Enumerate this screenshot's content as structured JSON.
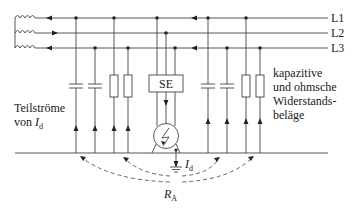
{
  "diagram": {
    "phases": [
      "L1",
      "L2",
      "L3"
    ],
    "phase_y": [
      18,
      33,
      48
    ],
    "ground_y": 153,
    "source_box_label": "SE",
    "labels": {
      "left_line1": "Teilströme",
      "left_line2_prefix": "von ",
      "left_line2_var": "I",
      "left_line2_sub": "d",
      "right_line1": "kapazitive",
      "right_line2": "und ohmsche",
      "right_line3": "Widerstands-",
      "right_line4": "beläge",
      "fault_current_var": "I",
      "fault_current_sub": "d",
      "earth_resistance_var": "R",
      "earth_resistance_sub": "A"
    },
    "branches_left": [
      {
        "type": "capacitor",
        "x": 76,
        "phase": "L1"
      },
      {
        "type": "capacitor",
        "x": 95,
        "phase": "L3"
      },
      {
        "type": "resistor",
        "x": 114,
        "phase": "L1"
      },
      {
        "type": "resistor",
        "x": 128,
        "phase": "L3"
      }
    ],
    "branches_right": [
      {
        "type": "capacitor",
        "x": 208,
        "phase": "L1"
      },
      {
        "type": "capacitor",
        "x": 227,
        "phase": "L3"
      },
      {
        "type": "resistor",
        "x": 246,
        "phase": "L1"
      },
      {
        "type": "resistor",
        "x": 260,
        "phase": "L3"
      }
    ],
    "icons": [
      "coil-icon",
      "capacitor-icon",
      "resistor-icon",
      "motor-fault-icon",
      "ground-icon"
    ]
  }
}
